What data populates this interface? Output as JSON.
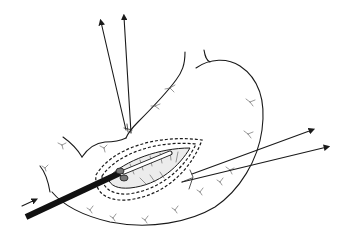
{
  "figure": {
    "colors": {
      "line": "#1a1a1a",
      "instrument": "#111111",
      "mucosa": "#d6d6d6",
      "background": "#ffffff"
    },
    "elements": {
      "stomach_outline": "stomach-outline",
      "incision": "elliptical incision with double dashed suture border",
      "instrument": "thick black rod entering from lower left",
      "traction_arrows_top": 2,
      "traction_arrows_right": 2,
      "insertion_arrow": 1
    }
  }
}
